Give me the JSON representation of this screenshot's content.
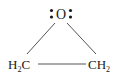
{
  "molecule": {
    "name": "ethylene oxide",
    "atoms": {
      "oxygen": {
        "symbol": "O",
        "lone_pairs": 2
      },
      "left_carbon": {
        "symbol": "H",
        "subscript": "2",
        "tail": "C"
      },
      "right_carbon": {
        "symbol": "CH",
        "subscript": "2"
      }
    },
    "bonds": [
      {
        "from": "oxygen",
        "to": "left_carbon",
        "type": "single"
      },
      {
        "from": "oxygen",
        "to": "right_carbon",
        "type": "single"
      },
      {
        "from": "left_carbon",
        "to": "right_carbon",
        "type": "single"
      }
    ],
    "colors": {
      "ink": "#1a1a1a",
      "bond": "#555555",
      "background": "#ffffff"
    }
  }
}
